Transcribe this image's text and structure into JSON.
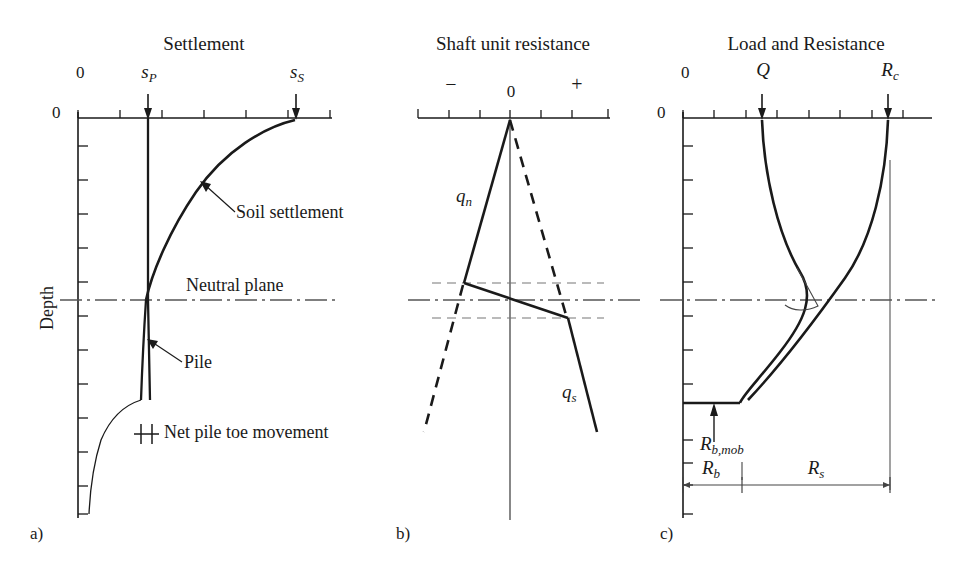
{
  "figure": {
    "panels": [
      {
        "id": "a",
        "id_label": "a)",
        "title": "Settlement",
        "axis_origin_label": "0",
        "axis_depth_zero_label": "0",
        "depth_axis_label": "Depth",
        "markers": [
          {
            "name": "pile-settlement",
            "label": "s",
            "sub": "P"
          },
          {
            "name": "soil-settlement",
            "label": "s",
            "sub": "S"
          }
        ],
        "annotations": [
          {
            "name": "soil-settlement-annotation",
            "text": "Soil settlement"
          },
          {
            "name": "neutral-plane-annotation",
            "text": "Neutral plane"
          },
          {
            "name": "pile-annotation",
            "text": "Pile"
          },
          {
            "name": "net-pile-toe-movement-annotation",
            "text": "Net pile toe movement"
          }
        ]
      },
      {
        "id": "b",
        "id_label": "b)",
        "title": "Shaft unit resistance",
        "axis_zero_label": "0",
        "axis_minus_label": "−",
        "axis_plus_label": "+",
        "curves": [
          {
            "name": "negative-shaft-resistance",
            "label": "q",
            "sub": "n"
          },
          {
            "name": "positive-shaft-resistance",
            "label": "q",
            "sub": "s"
          }
        ]
      },
      {
        "id": "c",
        "id_label": "c)",
        "title": "Load and Resistance",
        "axis_origin_label": "0",
        "axis_depth_zero_label": "0",
        "markers": [
          {
            "name": "applied-load",
            "label": "Q",
            "sub": ""
          },
          {
            "name": "total-resistance",
            "label": "R",
            "sub": "c"
          }
        ],
        "annotations": [
          {
            "name": "mobilized-toe-resistance",
            "label": "R",
            "sub": "b,mob"
          },
          {
            "name": "toe-resistance",
            "label": "R",
            "sub": "b"
          },
          {
            "name": "shaft-resistance",
            "label": "R",
            "sub": "s"
          }
        ]
      }
    ],
    "colors": {
      "line": "#1a1a1a",
      "thin_line": "#333333",
      "dash_line": "#555555",
      "background": "#ffffff"
    }
  }
}
